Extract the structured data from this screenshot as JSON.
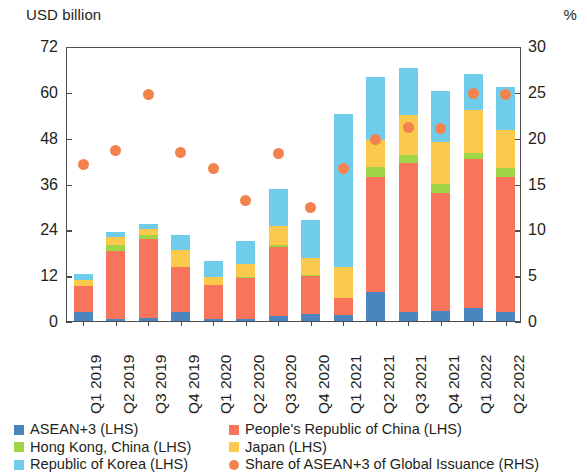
{
  "axis_titles": {
    "left": "USD billion",
    "right": "%"
  },
  "legend": {
    "column1": [
      {
        "label": "ASEAN+3 (LHS)",
        "color": "#4a85be",
        "shape": "square",
        "icon": "legend-square-icon"
      },
      {
        "label": "Hong Kong, China (LHS)",
        "color": "#9ed648",
        "shape": "square",
        "icon": "legend-square-icon"
      },
      {
        "label": "Republic of Korea (LHS)",
        "color": "#6fcdeb",
        "shape": "square",
        "icon": "legend-square-icon"
      }
    ],
    "column2": [
      {
        "label": "People's Republic of China (LHS)",
        "color": "#f8755b",
        "shape": "square",
        "icon": "legend-square-icon"
      },
      {
        "label": "Japan (LHS)",
        "color": "#fbc94b",
        "shape": "square",
        "icon": "legend-square-icon"
      },
      {
        "label": "Share of ASEAN+3 of Global Issuance (RHS)",
        "color": "#f3834e",
        "shape": "circle",
        "icon": "legend-circle-icon"
      }
    ]
  },
  "chart_data": {
    "type": "bar",
    "title": "",
    "subtitle": "",
    "xlabel": "",
    "ylabel": "USD billion",
    "y2label": "%",
    "ylim": [
      0,
      72
    ],
    "y2lim": [
      0,
      30
    ],
    "yticks": [
      0,
      12,
      24,
      36,
      48,
      60,
      72
    ],
    "y2ticks": [
      0,
      5,
      10,
      15,
      20,
      25,
      30
    ],
    "grid": false,
    "stacked": true,
    "legend_position": "bottom",
    "categories": [
      "Q1 2019",
      "Q2 2019",
      "Q3 2019",
      "Q4 2019",
      "Q1 2020",
      "Q2 2020",
      "Q3 2020",
      "Q4 2020",
      "Q1 2021",
      "Q2 2021",
      "Q3 2021",
      "Q4 2021",
      "Q1 2022",
      "Q2 2022"
    ],
    "series": [
      {
        "name": "ASEAN+3 (LHS)",
        "color": "#4a85be",
        "axis": "left",
        "values": [
          2.4,
          0.6,
          0.7,
          2.3,
          0.5,
          0.6,
          1.2,
          1.8,
          1.6,
          7.6,
          2.3,
          2.6,
          3.4,
          2.4
        ]
      },
      {
        "name": "People's Republic of China (LHS)",
        "color": "#f8755b",
        "axis": "left",
        "values": [
          6.8,
          17.8,
          20.8,
          11.8,
          8.9,
          10.6,
          18.1,
          10.1,
          4.4,
          30.0,
          39.2,
          30.9,
          39.1,
          35.3
        ]
      },
      {
        "name": "Hong Kong, China (LHS)",
        "color": "#9ed648",
        "axis": "left",
        "values": [
          0.0,
          1.6,
          1.1,
          0.0,
          0.0,
          0.3,
          0.5,
          0.2,
          0.0,
          2.6,
          1.9,
          2.4,
          1.4,
          2.4
        ]
      },
      {
        "name": "Japan (LHS)",
        "color": "#fbc94b",
        "axis": "left",
        "values": [
          1.6,
          2.0,
          1.6,
          4.6,
          2.0,
          3.4,
          5.1,
          4.3,
          8.2,
          7.3,
          10.6,
          11.1,
          11.4,
          9.8
        ]
      },
      {
        "name": "Republic of Korea (LHS)",
        "color": "#6fcdeb",
        "axis": "left",
        "values": [
          1.6,
          1.4,
          1.3,
          3.7,
          4.4,
          6.1,
          9.7,
          10.1,
          40.0,
          16.5,
          12.2,
          13.3,
          9.4,
          11.5
        ]
      }
    ],
    "scatter_series": [
      {
        "name": "Share of ASEAN+3 of Global Issuance (RHS)",
        "color": "#f3834e",
        "axis": "right",
        "marker": "circle",
        "values": [
          17.3,
          18.8,
          24.9,
          18.6,
          16.9,
          13.4,
          18.5,
          12.6,
          16.9,
          20.0,
          21.3,
          21.2,
          25.0,
          24.9
        ]
      }
    ]
  }
}
